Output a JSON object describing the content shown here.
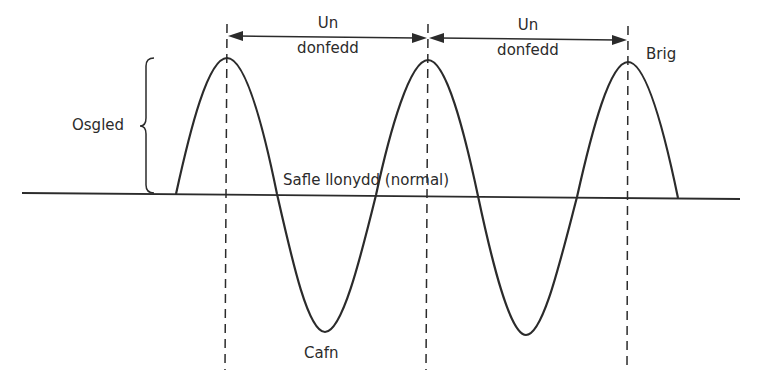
{
  "labels": {
    "wavelength_1_line1": "Un",
    "wavelength_1_line2": "donfedd",
    "wavelength_2_line1": "Un",
    "wavelength_2_line2": "donfedd",
    "amplitude": "Osgled",
    "rest_position": "Safle llonydd (normal)",
    "crest": "Brig",
    "trough": "Cafn"
  },
  "colors": {
    "stroke": "#2b2b2b",
    "text": "#2b2b2b",
    "background": "#ffffff"
  },
  "geometry": {
    "baseline": {
      "x1": 22,
      "y1": 193,
      "x2": 740,
      "y2": 199
    },
    "crests_x": [
      227,
      428,
      628
    ],
    "troughs_x": [
      325,
      526
    ]
  }
}
